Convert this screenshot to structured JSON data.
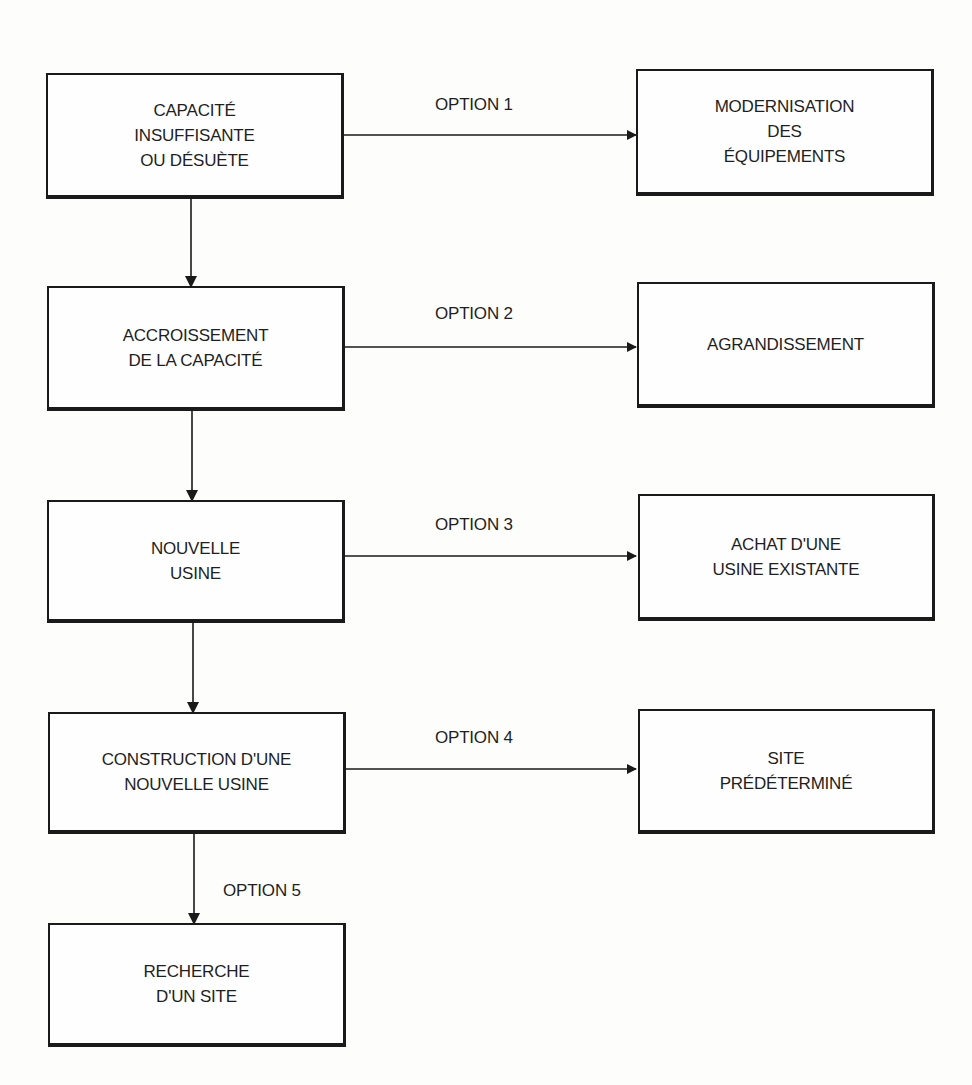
{
  "diagram": {
    "type": "flowchart",
    "main_flow": [
      {
        "id": "b1",
        "label": "CAPACITÉ\nINSUFFISANTE\nOU DÉSUÈTE"
      },
      {
        "id": "b2",
        "label": "ACCROISSEMENT\nDE  LA CAPACITÉ"
      },
      {
        "id": "b3",
        "label": "NOUVELLE\nUSINE"
      },
      {
        "id": "b4",
        "label": "CONSTRUCTION D'UNE\nNOUVELLE USINE"
      },
      {
        "id": "b5",
        "label": "RECHERCHE\nD'UN SITE"
      }
    ],
    "options": [
      {
        "id": "o1",
        "option_label": "OPTION 1",
        "from": "b1",
        "label": "MODERNISATION\nDES\nÉQUIPEMENTS"
      },
      {
        "id": "o2",
        "option_label": "OPTION 2",
        "from": "b2",
        "label": "AGRANDISSEMENT"
      },
      {
        "id": "o3",
        "option_label": "OPTION 3",
        "from": "b3",
        "label": "ACHAT D'UNE\nUSINE EXISTANTE"
      },
      {
        "id": "o4",
        "option_label": "OPTION 4",
        "from": "b4",
        "label": "SITE\nPRÉDÉTERMINÉ"
      },
      {
        "id": "o5",
        "option_label": "OPTION 5",
        "from": "b4",
        "to": "b5"
      }
    ],
    "colors": {
      "line": "#1a1a1a",
      "background": "#fdfdfb",
      "text": "#1f1f1f"
    }
  }
}
